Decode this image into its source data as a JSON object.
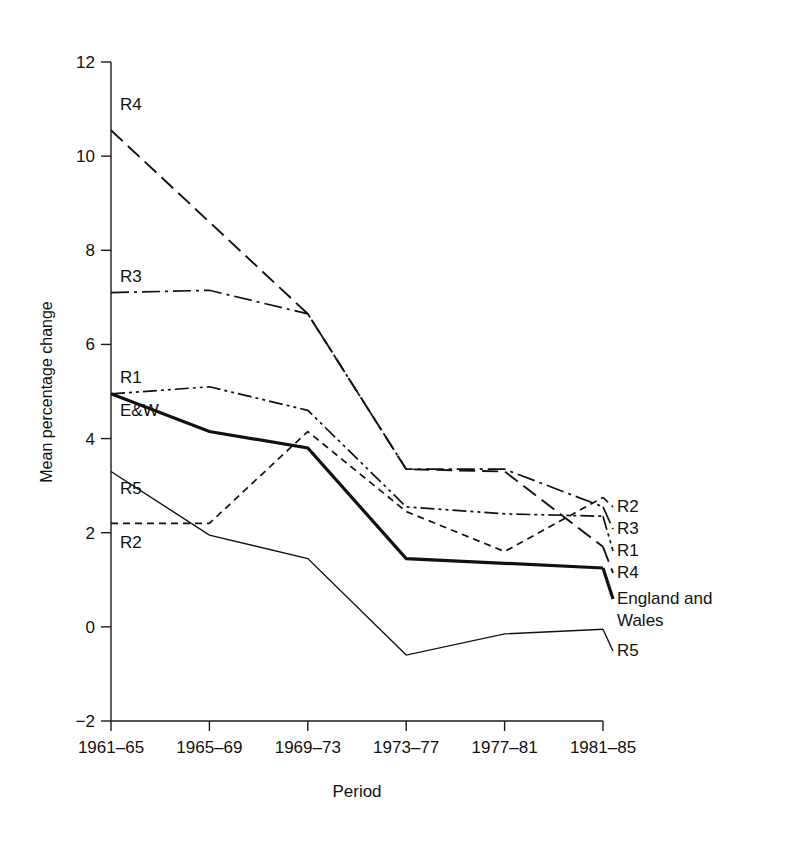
{
  "figure": {
    "title": "",
    "title_visible_fragment": ""
  },
  "chart_data": {
    "type": "line",
    "title": "",
    "xlabel": "Period",
    "ylabel": "Mean percentage change",
    "categories": [
      "1961–65",
      "1965–69",
      "1969–73",
      "1973–77",
      "1977–81",
      "1981–85"
    ],
    "ylim": [
      -2,
      12
    ],
    "yticks": [
      -2,
      0,
      2,
      4,
      6,
      8,
      10,
      12
    ],
    "ytick_labels": [
      "−2",
      "0",
      "2",
      "4",
      "6",
      "8",
      "10",
      "12"
    ],
    "grid": false,
    "legend": "inline-endpoint-labels",
    "series": [
      {
        "name": "R4",
        "left_label": "R4",
        "right_label": "R4",
        "style": "long-dash",
        "dash": "16,7",
        "width": 1.9,
        "values": [
          10.55,
          8.6,
          6.65,
          3.35,
          3.3,
          1.7
        ]
      },
      {
        "name": "R3",
        "left_label": "R3",
        "right_label": "R3",
        "style": "dash-dot",
        "dash": "18,5,3,5",
        "width": 1.7,
        "values": [
          7.1,
          7.15,
          6.65,
          3.35,
          3.35,
          2.55
        ]
      },
      {
        "name": "R1",
        "left_label": "R1",
        "right_label": "R1",
        "style": "dash-dot-dot",
        "dash": "14,4,3,4,3,4",
        "width": 1.7,
        "values": [
          4.95,
          5.1,
          4.6,
          2.55,
          2.4,
          2.35
        ]
      },
      {
        "name": "England and Wales",
        "left_label": "E&W",
        "right_label": "England and\nWales",
        "right_label_line1": "England and",
        "right_label_line2": "Wales",
        "style": "solid-thick",
        "dash": "",
        "width": 3.2,
        "values": [
          4.95,
          4.15,
          3.8,
          1.45,
          1.35,
          1.25
        ]
      },
      {
        "name": "R5",
        "left_label": "R5",
        "right_label": "R5",
        "style": "solid-thin",
        "dash": "",
        "width": 1.4,
        "values": [
          3.3,
          1.95,
          1.45,
          -0.6,
          -0.15,
          -0.05
        ]
      },
      {
        "name": "R2",
        "left_label": "R2",
        "right_label": "R2",
        "style": "short-dash",
        "dash": "7,5",
        "width": 1.7,
        "values": [
          2.2,
          2.2,
          4.15,
          2.45,
          1.6,
          2.75
        ]
      }
    ]
  },
  "axis": {
    "y_title": "Mean percentage change",
    "x_title": "Period"
  },
  "labels": {
    "left": [
      {
        "text": "R4",
        "series": "R4"
      },
      {
        "text": "R3",
        "series": "R3"
      },
      {
        "text": "R1",
        "series": "R1"
      },
      {
        "text": "E&W",
        "series": "England and Wales"
      },
      {
        "text": "R5",
        "series": "R5"
      },
      {
        "text": "R2",
        "series": "R2"
      }
    ],
    "right": [
      {
        "text": "R2",
        "series": "R2"
      },
      {
        "text": "R3",
        "series": "R3"
      },
      {
        "text": "R1",
        "series": "R1"
      },
      {
        "text": "R4",
        "series": "R4"
      },
      {
        "text": "England and",
        "series": "England and Wales"
      },
      {
        "text": "Wales",
        "series": "England and Wales"
      },
      {
        "text": "R5",
        "series": "R5"
      }
    ]
  },
  "colors": {
    "ink": "#111111",
    "background": "#ffffff"
  }
}
